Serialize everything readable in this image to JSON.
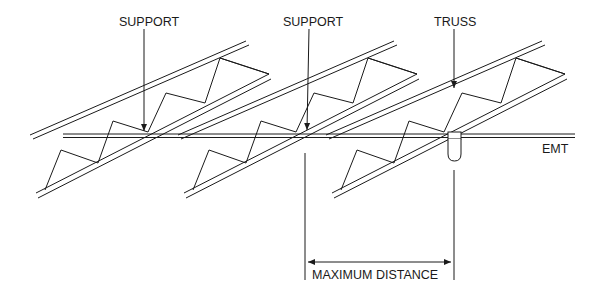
{
  "diagram": {
    "type": "technical-illustration",
    "labels": {
      "support_left": "SUPPORT",
      "support_middle": "SUPPORT",
      "truss": "TRUSS",
      "emt": "EMT",
      "max_distance": "MAXIMUM DISTANCE"
    },
    "elements": [
      {
        "name": "truss-1",
        "kind": "open-web truss (isometric)"
      },
      {
        "name": "truss-2",
        "kind": "open-web truss (isometric)"
      },
      {
        "name": "truss-3",
        "kind": "open-web truss (isometric)"
      },
      {
        "name": "emt-conduit",
        "kind": "horizontal double line"
      },
      {
        "name": "hanger-strap",
        "kind": "rounded clamp at truss 3"
      },
      {
        "name": "dimension-max-distance",
        "kind": "dimension between support and hanger"
      }
    ],
    "colors": {
      "line": "#1a1a1a",
      "background": "#ffffff"
    }
  }
}
